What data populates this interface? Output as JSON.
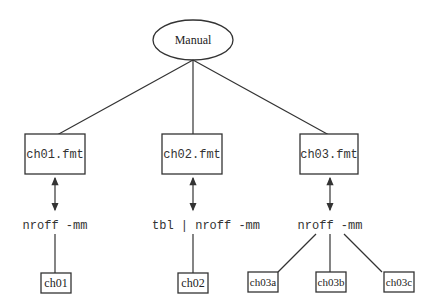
{
  "diagram": {
    "root": {
      "label": "Manual",
      "shape": "ellipse"
    },
    "chapters": [
      {
        "file": "ch01.fmt",
        "command": "nroff -mm",
        "outputs": [
          "ch01"
        ]
      },
      {
        "file": "ch02.fmt",
        "command": "tbl | nroff -mm",
        "outputs": [
          "ch02"
        ]
      },
      {
        "file": "ch03.fmt",
        "command": "nroff -mm",
        "outputs": [
          "ch03a",
          "ch03b",
          "ch03c"
        ]
      }
    ]
  }
}
